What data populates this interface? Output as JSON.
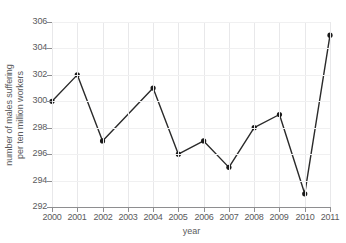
{
  "chart_data": {
    "type": "line",
    "title": "",
    "xlabel": "year",
    "ylabel": "number of males suffering per ten million workers",
    "ylabel_lines": [
      "number of males suffering",
      "per ten million workers"
    ],
    "categories": [
      "2000",
      "2001",
      "2002",
      "2003",
      "2004",
      "2005",
      "2006",
      "2007",
      "2008",
      "2009",
      "2010",
      "2011"
    ],
    "x": [
      2000,
      2001,
      2002,
      2003,
      2004,
      2005,
      2006,
      2007,
      2008,
      2009,
      2010,
      2011
    ],
    "values": [
      300,
      302,
      297,
      null,
      301,
      296,
      297,
      295,
      298,
      299,
      293,
      305
    ],
    "series": [
      {
        "name": "number of males suffering per ten million workers",
        "points": [
          {
            "x": "2000",
            "y": 300,
            "marker": true
          },
          {
            "x": "2001",
            "y": 302,
            "marker": true
          },
          {
            "x": "2002",
            "y": 297,
            "marker": true
          },
          {
            "x": "2003",
            "y": null,
            "marker": false
          },
          {
            "x": "2004",
            "y": 301,
            "marker": true
          },
          {
            "x": "2005",
            "y": 296,
            "marker": true
          },
          {
            "x": "2006",
            "y": 297,
            "marker": true
          },
          {
            "x": "2007",
            "y": 295,
            "marker": true
          },
          {
            "x": "2008",
            "y": 298,
            "marker": true
          },
          {
            "x": "2009",
            "y": 299,
            "marker": true
          },
          {
            "x": "2010",
            "y": 293,
            "marker": true
          },
          {
            "x": "2011",
            "y": 305,
            "marker": true
          }
        ]
      }
    ],
    "ylim": [
      292,
      306
    ],
    "xlim": [
      2000,
      2011
    ],
    "yticks": [
      292,
      294,
      296,
      298,
      300,
      302,
      304,
      306
    ],
    "ytick_labels": [
      "292",
      "294",
      "296",
      "298",
      "300",
      "302",
      "304",
      "306"
    ],
    "xticks": [
      2000,
      2001,
      2002,
      2003,
      2004,
      2005,
      2006,
      2007,
      2008,
      2009,
      2010,
      2011
    ],
    "xtick_labels": [
      "2000",
      "2001",
      "2002",
      "2003",
      "2004",
      "2005",
      "2006",
      "2007",
      "2008",
      "2009",
      "2010",
      "2011"
    ],
    "grid": true,
    "grid_axis": "both",
    "legend": false,
    "legend_position": "none",
    "line_color": "#2a2a2a",
    "marker_color": "#1a1a1a",
    "marker_shape": "circle",
    "grid_color": "#e8e8ea",
    "axis_color": "#8e8e90",
    "text_color": "#5a5a5c",
    "background_color": "#ffffff"
  }
}
